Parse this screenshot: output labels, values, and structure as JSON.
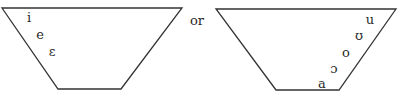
{
  "diagram": {
    "type": "vowel-trapezoid",
    "connector": "or",
    "colors": {
      "stroke": "#333333",
      "text": "#2a2a2a",
      "background": "#ffffff"
    },
    "left": {
      "shape": [
        [
          2,
          8
        ],
        [
          182,
          8
        ],
        [
          121,
          89
        ],
        [
          58,
          89
        ]
      ],
      "vowels": [
        {
          "symbol": "i",
          "x": 29,
          "y": 17
        },
        {
          "symbol": "e",
          "x": 40,
          "y": 34
        },
        {
          "symbol": "ɛ",
          "x": 52,
          "y": 51
        }
      ]
    },
    "right": {
      "shape": [
        [
          216,
          9
        ],
        [
          396,
          9
        ],
        [
          339,
          90
        ],
        [
          276,
          90
        ]
      ],
      "vowels": [
        {
          "symbol": "u",
          "x": 370,
          "y": 19
        },
        {
          "symbol": "ʊ",
          "x": 359,
          "y": 35
        },
        {
          "symbol": "o",
          "x": 346,
          "y": 52
        },
        {
          "symbol": "ɔ",
          "x": 334,
          "y": 68
        },
        {
          "symbol": "a",
          "x": 322,
          "y": 83
        }
      ]
    }
  }
}
